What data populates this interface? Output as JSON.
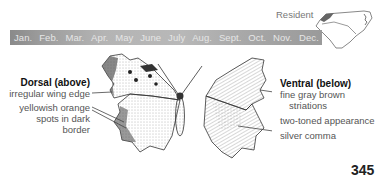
{
  "range": {
    "label": "Resident",
    "map_icon": "nc-sc-range-map-icon"
  },
  "months": [
    "Jan.",
    "Feb.",
    "Mar.",
    "Apr.",
    "May",
    "June",
    "July",
    "Aug.",
    "Sept.",
    "Oct.",
    "Nov.",
    "Dec."
  ],
  "dorsal": {
    "title": "Dorsal (above)",
    "notes": [
      "irregular wing edge",
      "yellowish orange",
      "spots in dark",
      "border"
    ]
  },
  "ventral": {
    "title": "Ventral (below)",
    "notes": [
      "fine gray brown",
      "striations",
      "two-toned appearance",
      "silver comma"
    ]
  },
  "illustration": "butterfly-illustration",
  "page_number": "345"
}
